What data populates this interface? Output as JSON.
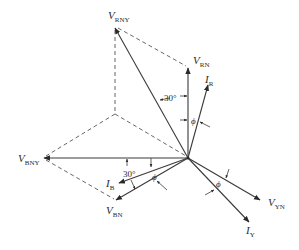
{
  "diagram": {
    "origin": {
      "x": 188,
      "y": 158
    },
    "phasors": [
      {
        "id": "V_RN",
        "symbol": "V",
        "subscript": "RN",
        "kind": "voltage",
        "tip": {
          "x": 188,
          "y": 68
        }
      },
      {
        "id": "V_YN",
        "symbol": "V",
        "subscript": "YN",
        "kind": "voltage",
        "tip": {
          "x": 260,
          "y": 200
        }
      },
      {
        "id": "V_BN",
        "symbol": "V",
        "subscript": "BN",
        "kind": "voltage",
        "tip": {
          "x": 116,
          "y": 200
        }
      },
      {
        "id": "V_RNY",
        "symbol": "V",
        "subscript": "RNY",
        "kind": "resultant-voltage",
        "tip": {
          "x": 115,
          "y": 27
        }
      },
      {
        "id": "V_BNY",
        "symbol": "V",
        "subscript": "BNY",
        "kind": "resultant-voltage",
        "tip": {
          "x": 44,
          "y": 158
        }
      },
      {
        "id": "I_R",
        "symbol": "I",
        "subscript": "R",
        "kind": "current",
        "tip": {
          "x": 208,
          "y": 85
        }
      },
      {
        "id": "I_Y",
        "symbol": "I",
        "subscript": "Y",
        "kind": "current",
        "tip": {
          "x": 249,
          "y": 222
        }
      },
      {
        "id": "I_B",
        "symbol": "I",
        "subscript": "B",
        "kind": "current",
        "tip": {
          "x": 119,
          "y": 183
        }
      }
    ],
    "labels": {
      "v_rny": {
        "main": "V",
        "sub": "RNY"
      },
      "v_rn": {
        "main": "V",
        "sub": "RN"
      },
      "i_r": {
        "main": "I",
        "sub": "R"
      },
      "v_bny": {
        "main": "V",
        "sub": "BNY"
      },
      "i_b": {
        "main": "I",
        "sub": "B"
      },
      "v_bn": {
        "main": "V",
        "sub": "BN"
      },
      "v_yn": {
        "main": "V",
        "sub": "YN"
      },
      "i_y": {
        "main": "I",
        "sub": "Y"
      }
    },
    "angles": {
      "upper_30": "30°",
      "lower_30": "30°",
      "phi_r": "ϕ",
      "phi_b": "ϕ",
      "phi_y": "ϕ"
    },
    "construction_lines": "dashed parallelogram (−V_YN reflected) for V_RNY and V_BNY",
    "colors": {
      "line": "#3a3a3a",
      "dashed": "#555555",
      "background": "#ffffff",
      "text": "#2a2a2a"
    }
  }
}
